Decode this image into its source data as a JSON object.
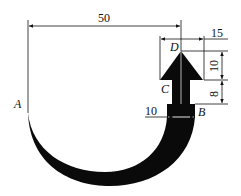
{
  "points": {
    "A": "A",
    "B": "B",
    "C": "C",
    "D": "D"
  },
  "dimensions": {
    "horizontal_span": "50",
    "arrow_head_half_width": "15",
    "arrow_head_height": "10",
    "stem_height": "8",
    "base_width": "10"
  },
  "colors": {
    "shape": "#0a0a0a",
    "lines": "#111111",
    "background": "#ffffff"
  }
}
